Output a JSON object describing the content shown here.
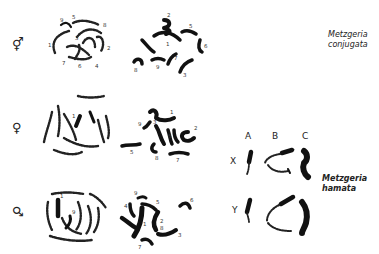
{
  "figure": {
    "rows": [
      {
        "id": "monoecious",
        "sex_symbol": "⚥",
        "sex_icon": "hermaphrodite-symbol",
        "prophase_labels": [
          "1",
          "2",
          "3",
          "4",
          "5",
          "6",
          "7",
          "8",
          "9"
        ],
        "metaphase_labels": [
          "1",
          "2",
          "3",
          "4",
          "5",
          "6",
          "7",
          "8",
          "9"
        ]
      },
      {
        "id": "female",
        "sex_symbol": "♀",
        "sex_icon": "female-symbol",
        "prophase_labels": [
          "1"
        ],
        "metaphase_labels": [
          "1",
          "2",
          "3",
          "4",
          "5",
          "6",
          "7",
          "8",
          "9"
        ]
      },
      {
        "id": "male",
        "sex_symbol": "♂",
        "sex_icon": "male-symbol",
        "prophase_labels": [
          "1",
          "9"
        ],
        "metaphase_labels": [
          "1",
          "2",
          "3",
          "4",
          "5",
          "6",
          "7",
          "8",
          "9"
        ]
      }
    ],
    "species_1": {
      "line1": "Metzgeria",
      "line2": "conjugata"
    },
    "species_2": {
      "line1": "Metzgeria",
      "line2": "hamata"
    },
    "sex_chromosome_panel": {
      "columns": [
        "A",
        "B",
        "C"
      ],
      "rows": [
        "X",
        "Y"
      ]
    }
  }
}
